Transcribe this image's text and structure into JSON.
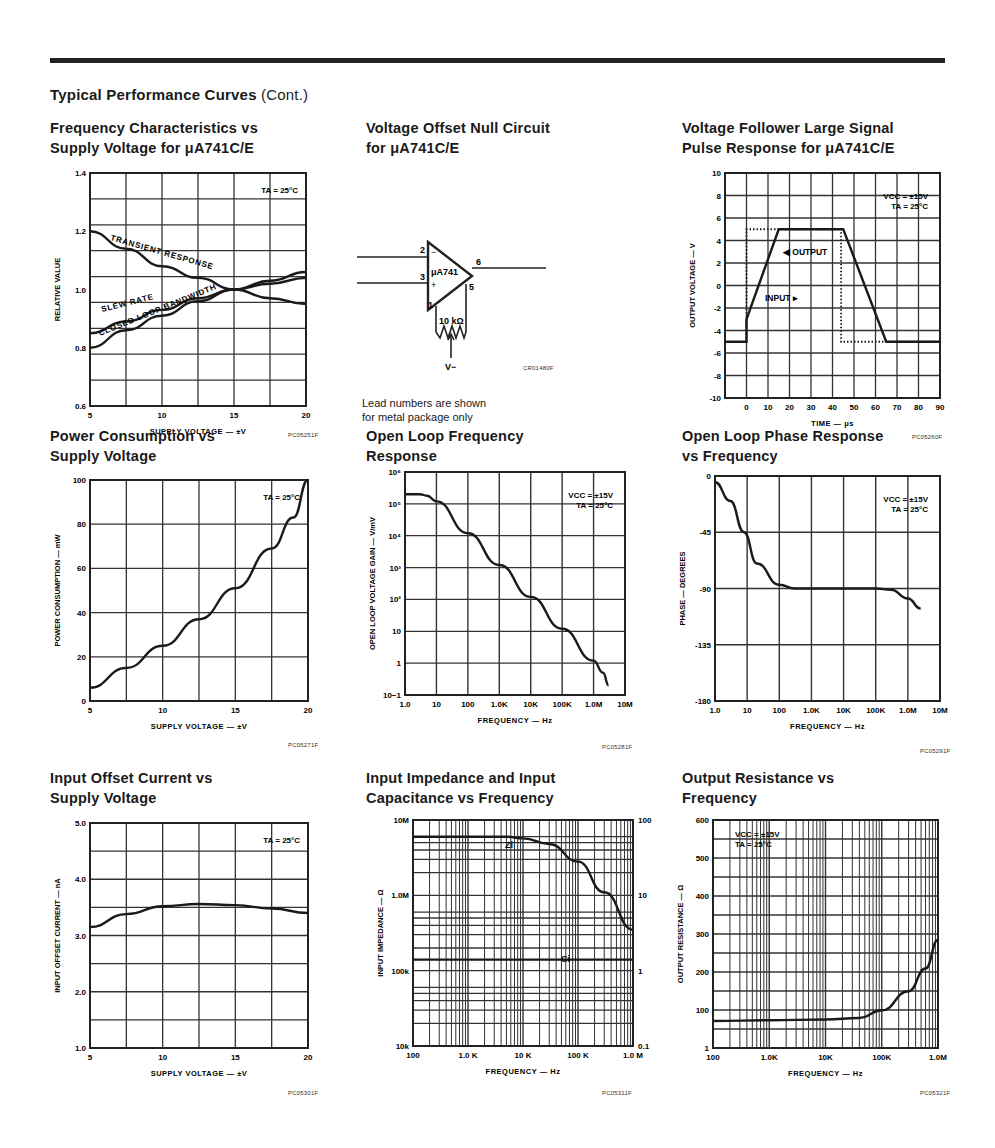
{
  "page": {
    "section_title": "Typical Performance Curves",
    "section_suffix": "(Cont.)"
  },
  "panels": [
    {
      "id": "freq-char",
      "title": "Frequency Characteristics vs\nSupply Voltage for μA741C/E",
      "code": "PC05251F"
    },
    {
      "id": "null-circuit",
      "title": "Voltage Offset Null Circuit\nfor μA741C/E",
      "code": "CR01480F",
      "note": "Lead numbers are shown\nfor metal package only"
    },
    {
      "id": "pulse",
      "title": "Voltage Follower Large Signal\nPulse Response for μA741C/E",
      "code": "PC05260F"
    },
    {
      "id": "power",
      "title": "Power Consumption vs\nSupply Voltage",
      "code": "PC05271F"
    },
    {
      "id": "olgain",
      "title": "Open Loop Frequency\nResponse",
      "code": "PC05281F"
    },
    {
      "id": "olphase",
      "title": "Open Loop Phase Response\nvs Frequency",
      "code": "PC05291F"
    },
    {
      "id": "ios",
      "title": "Input Offset Current vs\nSupply Voltage",
      "code": "PC05301F"
    },
    {
      "id": "zin",
      "title": "Input Impedance and Input\nCapacitance vs Frequency",
      "code": "PC05311F"
    },
    {
      "id": "rout",
      "title": "Output Resistance vs\nFrequency",
      "code": "PC05321F"
    }
  ],
  "circuit": {
    "opamp_label": "μA741",
    "pins": [
      "2",
      "3",
      "6",
      "1",
      "5"
    ],
    "inv": "−",
    "noninv": "+",
    "pot_label": "10 kΩ",
    "supply_label": "V−"
  },
  "chart_data": [
    {
      "id": "freq-char",
      "type": "line",
      "title": "Frequency Characteristics vs Supply Voltage for μA741C/E",
      "xlabel": "SUPPLY VOLTAGE — ±V",
      "ylabel": "RELATIVE VALUE",
      "xlim": [
        5,
        20
      ],
      "ylim": [
        0.6,
        1.4
      ],
      "grid": true,
      "xticks": [
        "5",
        "10",
        "15",
        "20"
      ],
      "yticks": [
        "0.6",
        "0.8",
        "1.0",
        "1.2",
        "1.4"
      ],
      "annotation": "TA = 25°C",
      "x": [
        5,
        7.5,
        10,
        12.5,
        15,
        17.5,
        20
      ],
      "series": [
        {
          "name": "TRANSIENT RESPONSE",
          "values": [
            1.2,
            1.14,
            1.08,
            1.04,
            1.0,
            0.97,
            0.95
          ]
        },
        {
          "name": "SLEW RATE",
          "values": [
            0.85,
            0.89,
            0.93,
            0.97,
            1.0,
            1.02,
            1.04
          ]
        },
        {
          "name": "CLOSED LOOP BANDWIDTH",
          "values": [
            0.8,
            0.86,
            0.91,
            0.96,
            1.0,
            1.03,
            1.06
          ]
        }
      ]
    },
    {
      "id": "pulse",
      "type": "line",
      "title": "Voltage Follower Large Signal Pulse Response for μA741C/E",
      "xlabel": "TIME — μs",
      "ylabel": "OUTPUT VOLTAGE — V",
      "xlim": [
        -10,
        90
      ],
      "ylim": [
        -10,
        10
      ],
      "grid": true,
      "xticks": [
        "0",
        "10",
        "20",
        "30",
        "40",
        "50",
        "60",
        "70",
        "80",
        "90"
      ],
      "yticks": [
        "10",
        "8",
        "6",
        "4",
        "2",
        "0",
        "-2",
        "-4",
        "-6",
        "-8",
        "-10"
      ],
      "annotation": "VCC = ±15V\nTA = 25°C",
      "series": [
        {
          "name": "OUTPUT",
          "x": [
            -10,
            0,
            0,
            15,
            45,
            65,
            90
          ],
          "values": [
            -5,
            -5,
            -3,
            5,
            5,
            -5,
            -5
          ]
        },
        {
          "name": "INPUT",
          "style": "dotted",
          "x": [
            0,
            0,
            44,
            44,
            90
          ],
          "values": [
            -5,
            5,
            5,
            -5,
            -5
          ]
        }
      ]
    },
    {
      "id": "power",
      "type": "line",
      "title": "Power Consumption vs Supply Voltage",
      "xlabel": "SUPPLY VOLTAGE — ±V",
      "ylabel": "POWER CONSUMPTION — mW",
      "xlim": [
        5,
        20
      ],
      "ylim": [
        0,
        100
      ],
      "grid": true,
      "xticks": [
        "5",
        "10",
        "15",
        "20"
      ],
      "yticks": [
        "0",
        "20",
        "40",
        "60",
        "80",
        "100"
      ],
      "annotation": "TA = 25°C",
      "x": [
        5,
        7.5,
        10,
        12.5,
        15,
        17.5,
        19,
        20
      ],
      "values": [
        6,
        15,
        25,
        37,
        51,
        69,
        83,
        100
      ]
    },
    {
      "id": "olgain",
      "type": "line",
      "title": "Open Loop Frequency Response",
      "xlabel": "FREQUENCY — Hz",
      "ylabel": "OPEN LOOP VOLTAGE GAIN — V/mV",
      "xscale": "log",
      "yscale": "log",
      "xlim": [
        1,
        10000000
      ],
      "ylim": [
        0.1,
        1000000
      ],
      "grid": true,
      "xticks": [
        "1.0",
        "10",
        "100",
        "1.0K",
        "10K",
        "100K",
        "1.0M",
        "10M"
      ],
      "yticks": [
        "10−1",
        "1",
        "10",
        "10²",
        "10³",
        "10⁴",
        "10⁵",
        "10⁶"
      ],
      "annotation": "VCC = ±15V\nTA = 25°C",
      "x": [
        1,
        3,
        5,
        10,
        100,
        1000,
        10000,
        100000,
        1000000,
        2000000,
        3000000
      ],
      "values": [
        200000,
        200000,
        180000,
        120000,
        12000,
        1200,
        120,
        12,
        1.2,
        0.5,
        0.2
      ]
    },
    {
      "id": "olphase",
      "type": "line",
      "title": "Open Loop Phase Response vs Frequency",
      "xlabel": "FREQUENCY — Hz",
      "ylabel": "PHASE — DEGREES",
      "xscale": "log",
      "xlim": [
        1,
        10000000
      ],
      "ylim": [
        -180,
        0
      ],
      "grid": true,
      "xticks": [
        "1.0",
        "10",
        "100",
        "1.0K",
        "10K",
        "100K",
        "1.0M",
        "10M"
      ],
      "yticks": [
        "0",
        "-45",
        "-90",
        "-135",
        "-180"
      ],
      "annotation": "VCC = ±15V\nTA = 25°C",
      "x": [
        1,
        3,
        8,
        20,
        100,
        300,
        1000,
        100000,
        300000,
        1000000,
        2500000
      ],
      "values": [
        -5,
        -20,
        -45,
        -70,
        -87,
        -90,
        -90,
        -90,
        -91,
        -98,
        -106
      ]
    },
    {
      "id": "ios",
      "type": "line",
      "title": "Input Offset Current vs Supply Voltage",
      "xlabel": "SUPPLY VOLTAGE — ±V",
      "ylabel": "INPUT OFFSET CURRENT — nA",
      "xlim": [
        5,
        20
      ],
      "ylim": [
        1.0,
        5.0
      ],
      "grid": true,
      "xticks": [
        "5",
        "10",
        "15",
        "20"
      ],
      "yticks": [
        "1.0",
        "2.0",
        "3.0",
        "4.0",
        "5.0"
      ],
      "annotation": "TA = 25°C",
      "x": [
        5,
        7.5,
        10,
        12.5,
        15,
        17.5,
        20
      ],
      "values": [
        3.15,
        3.38,
        3.52,
        3.56,
        3.54,
        3.48,
        3.4
      ]
    },
    {
      "id": "zin",
      "type": "line",
      "title": "Input Impedance and Input Capacitance vs Frequency",
      "xlabel": "FREQUENCY — Hz",
      "ylabel": "INPUT IMPEDANCE — Ω",
      "y2label": "INPUT CAPACITANCE — pF",
      "xscale": "log",
      "yscale": "log",
      "xlim": [
        100,
        1000000
      ],
      "ylim": [
        10000,
        10000000
      ],
      "y2lim": [
        0.1,
        100
      ],
      "grid": true,
      "xticks": [
        "100",
        "1.0 K",
        "10 K",
        "100 K",
        "1.0 M"
      ],
      "yticks": [
        "10k",
        "100k",
        "1.0M",
        "10M"
      ],
      "y2ticks": [
        "0.1",
        "1",
        "10",
        "100"
      ],
      "series": [
        {
          "name": "Zi",
          "axis": "left",
          "x": [
            100,
            1000,
            5000,
            10000,
            30000,
            100000,
            300000,
            1000000
          ],
          "values": [
            6000000,
            6000000,
            6000000,
            5700000,
            4800000,
            2800000,
            1100000,
            350000
          ]
        },
        {
          "name": "Ci",
          "axis": "right",
          "x": [
            100,
            1000000
          ],
          "values": [
            1.4,
            1.4
          ]
        }
      ]
    },
    {
      "id": "rout",
      "type": "line",
      "title": "Output Resistance vs Frequency",
      "xlabel": "FREQUENCY — Hz",
      "ylabel": "OUTPUT RESISTANCE — Ω",
      "xscale": "log",
      "xlim": [
        100,
        1000000
      ],
      "ylim": [
        1,
        600
      ],
      "grid": true,
      "xticks": [
        "100",
        "1.0K",
        "10K",
        "100K",
        "1.0M"
      ],
      "yticks": [
        "1",
        "100",
        "200",
        "300",
        "400",
        "500",
        "600"
      ],
      "annotation": "VCC = ±15V\nTA = 25°C",
      "x": [
        100,
        1000,
        10000,
        40000,
        100000,
        300000,
        600000,
        1000000
      ],
      "values": [
        72,
        74,
        76,
        80,
        100,
        150,
        210,
        285
      ]
    }
  ]
}
